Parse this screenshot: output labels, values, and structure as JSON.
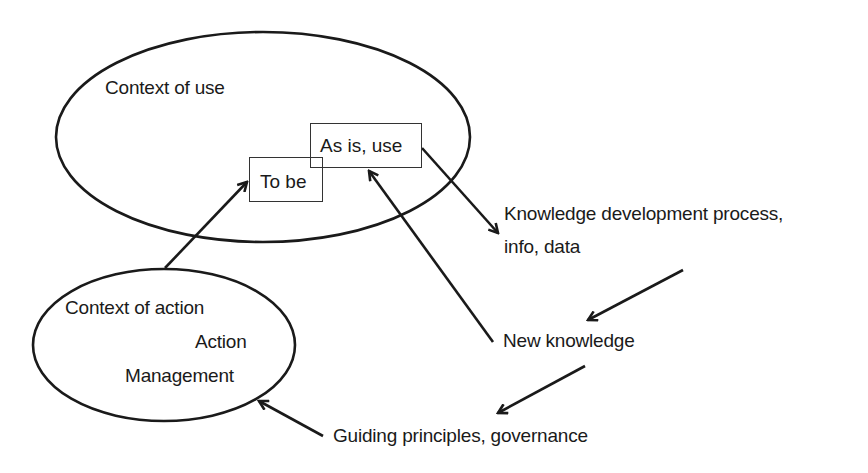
{
  "diagram": {
    "colors": {
      "stroke": "#1a1a1a",
      "text": "#1a1a1a",
      "background": "#ffffff"
    },
    "nodes": {
      "context_of_use": {
        "label": "Context of use",
        "shape": "ellipse"
      },
      "as_is_use": {
        "label": "As is, use",
        "shape": "rectangle"
      },
      "to_be": {
        "label": "To be",
        "shape": "rectangle"
      },
      "context_of_action": {
        "shape": "ellipse",
        "line1": "Context of action",
        "line2": "Action",
        "line3": "Management"
      },
      "knowledge_dev": {
        "line1": "Knowledge development process,",
        "line2": "info, data"
      },
      "new_knowledge": {
        "label": "New knowledge"
      },
      "guiding_principles": {
        "label": "Guiding principles, governance"
      }
    },
    "edges": [
      {
        "from": "context_of_action",
        "to": "to_be"
      },
      {
        "from": "as_is_use",
        "to": "knowledge_dev"
      },
      {
        "from": "knowledge_dev",
        "to": "new_knowledge"
      },
      {
        "from": "new_knowledge",
        "to": "as_is_use"
      },
      {
        "from": "new_knowledge",
        "to": "guiding_principles"
      },
      {
        "from": "guiding_principles",
        "to": "context_of_action"
      }
    ]
  }
}
